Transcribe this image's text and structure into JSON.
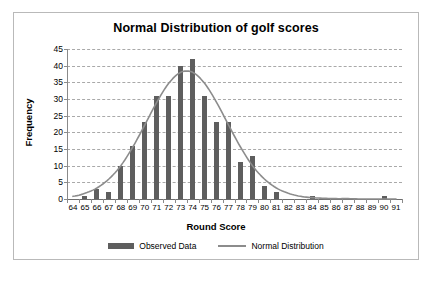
{
  "chart_data": {
    "type": "bar",
    "title": "Normal Distribution of golf scores",
    "xlabel": "Round Score",
    "ylabel": "Frequency",
    "xlim": [
      63.5,
      91.5
    ],
    "ylim": [
      0,
      45
    ],
    "ytick_step": 5,
    "grid": true,
    "legend_position": "bottom",
    "categories": [
      64,
      65,
      66,
      67,
      68,
      69,
      70,
      71,
      72,
      73,
      74,
      75,
      76,
      77,
      78,
      79,
      80,
      81,
      82,
      83,
      84,
      85,
      86,
      87,
      88,
      89,
      90,
      91
    ],
    "ytick_labels": [
      0,
      5,
      10,
      15,
      20,
      25,
      30,
      35,
      40,
      45
    ],
    "xtick_labels": [
      64,
      65,
      66,
      67,
      68,
      69,
      70,
      71,
      72,
      73,
      74,
      75,
      76,
      77,
      78,
      79,
      80,
      81,
      82,
      83,
      84,
      85,
      86,
      87,
      88,
      89,
      90,
      91
    ],
    "series": [
      {
        "name": "Observed Data",
        "type": "bar",
        "color": "#5e5e5e",
        "values": [
          0,
          1,
          3,
          2,
          10,
          16,
          23,
          31,
          31,
          40,
          42,
          31,
          23,
          23,
          11,
          13,
          4,
          2,
          0,
          0,
          1,
          0,
          0,
          0,
          0,
          0,
          1,
          0
        ]
      },
      {
        "name": "Normal Distribution",
        "type": "line",
        "color": "#8c8c8c",
        "values": [
          0.8,
          1.7,
          3.3,
          6.0,
          10.0,
          15.6,
          22.2,
          29.0,
          34.7,
          38.0,
          38.0,
          34.7,
          29.0,
          22.2,
          15.6,
          10.0,
          6.0,
          3.3,
          1.7,
          0.8,
          0.4,
          0.2,
          0.1,
          0.1,
          0.0,
          0.0,
          0.0,
          0.0
        ]
      }
    ]
  },
  "legend": {
    "items": [
      {
        "label": "Observed Data"
      },
      {
        "label": "Normal Distribution"
      }
    ]
  }
}
